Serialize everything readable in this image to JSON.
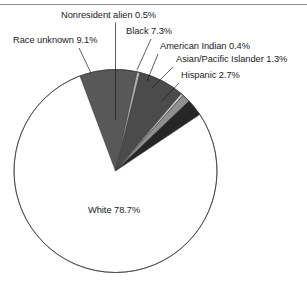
{
  "figure": {
    "background_color": "#ffffff",
    "rule_color": "#8a8a8a"
  },
  "chart_data": {
    "type": "pie",
    "title": "",
    "xlabel": "",
    "ylabel": "",
    "legend_position": "none",
    "grid": false,
    "units": "percent",
    "total": 100.0,
    "start_angle_deg": -20.5,
    "direction": "clockwise",
    "categories": [
      "Race unknown",
      "Nonresident alien",
      "Black",
      "American Indian",
      "Asian/Pacific Islander",
      "Hispanic",
      "White"
    ],
    "values": [
      9.1,
      0.5,
      7.3,
      0.4,
      1.3,
      2.7,
      78.7
    ],
    "colors": [
      "#585858",
      "#b3b3b3",
      "#4b4b4b",
      "#c9c9c9",
      "#8f8f8f",
      "#262626",
      "#ffffff"
    ],
    "slices": [
      {
        "label": "Race unknown",
        "value": 9.1,
        "value_text": "9.1%",
        "label_text": "Race unknown 9.1%",
        "color": "#585858"
      },
      {
        "label": "Nonresident alien",
        "value": 0.5,
        "value_text": "0.5%",
        "label_text": "Nonresident alien 0.5%",
        "color": "#b3b3b3"
      },
      {
        "label": "Black",
        "value": 7.3,
        "value_text": "7.3%",
        "label_text": "Black 7.3%",
        "color": "#4b4b4b"
      },
      {
        "label": "American Indian",
        "value": 0.4,
        "value_text": "0.4%",
        "label_text": "American Indian 0.4%",
        "color": "#c9c9c9"
      },
      {
        "label": "Asian/Pacific Islander",
        "value": 1.3,
        "value_text": "1.3%",
        "label_text": "Asian/Pacific Islander 1.3%",
        "color": "#8f8f8f"
      },
      {
        "label": "Hispanic",
        "value": 2.7,
        "value_text": "2.7%",
        "label_text": "Hispanic 2.7%",
        "color": "#262626"
      },
      {
        "label": "White",
        "value": 78.7,
        "value_text": "78.7%",
        "label_text": "White 78.7%",
        "color": "#ffffff"
      }
    ]
  },
  "labels": {
    "nonresident_alien": "Nonresident alien 0.5%",
    "race_unknown": "Race unknown 9.1%",
    "black": "Black 7.3%",
    "american_indian": "American Indian 0.4%",
    "asian_pacific_islander": "Asian/Pacific Islander 1.3%",
    "hispanic": "Hispanic 2.7%",
    "white": "White 78.7%"
  }
}
